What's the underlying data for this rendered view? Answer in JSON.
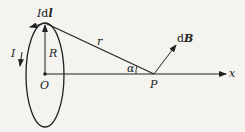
{
  "diagram": {
    "labels": {
      "current_element_prefix": "I",
      "current_element_d": "d",
      "current_element_l": "l",
      "current": "I",
      "radius": "R",
      "distance": "r",
      "center": "O",
      "point": "P",
      "angle": "α",
      "field_d": "d",
      "field_B": "B",
      "axis": "x"
    },
    "colors": {
      "stroke": "#222222",
      "background": "#f4f3f0"
    }
  }
}
